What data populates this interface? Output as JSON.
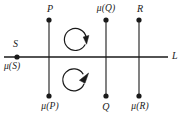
{
  "figure": {
    "type": "geometric-diagram",
    "colors": {
      "stroke": "#1a1a1a",
      "background": "#ffffff",
      "label": "#1a1a1a"
    },
    "horizontal_line": {
      "name": "L",
      "label": "L",
      "x_start": 4,
      "x_end": 168,
      "y": 57
    },
    "points": [
      {
        "id": "S",
        "label": "S",
        "label_position": "above",
        "x": 17,
        "y": 57,
        "on_line": true
      },
      {
        "id": "mu-S",
        "label": "μ(S)",
        "label_position": "below",
        "x": 17,
        "y": 57,
        "on_line": true
      },
      {
        "id": "P",
        "label": "P",
        "label_position": "above",
        "x": 49,
        "y": 20
      },
      {
        "id": "mu-P",
        "label": "μ(P)",
        "label_position": "below",
        "x": 49,
        "y": 96
      },
      {
        "id": "mu-Q",
        "label": "μ(Q)",
        "label_position": "above",
        "x": 106,
        "y": 20
      },
      {
        "id": "Q",
        "label": "Q",
        "label_position": "below",
        "x": 106,
        "y": 96
      },
      {
        "id": "R",
        "label": "R",
        "label_position": "above",
        "x": 139,
        "y": 20
      },
      {
        "id": "mu-R",
        "label": "μ(R)",
        "label_position": "below",
        "x": 139,
        "y": 96
      }
    ],
    "vertical_lines": [
      {
        "id": "line-P",
        "x": 49,
        "y_top": 20,
        "y_bottom": 96
      },
      {
        "id": "line-Q",
        "x": 106,
        "y_top": 20,
        "y_bottom": 96
      },
      {
        "id": "line-R",
        "x": 139,
        "y_top": 20,
        "y_bottom": 96
      }
    ],
    "rotation_arrows": [
      {
        "id": "arrow-upper",
        "cx": 77,
        "cy": 40,
        "r": 11,
        "direction": "clockwise",
        "region": "above-line"
      },
      {
        "id": "arrow-lower",
        "cx": 77,
        "cy": 80,
        "r": 11,
        "direction": "counterclockwise",
        "region": "below-line"
      }
    ],
    "labels": {
      "S": "S",
      "mu_S": "μ(S)",
      "P": "P",
      "mu_P": "μ(P)",
      "mu_Q": "μ(Q)",
      "Q": "Q",
      "R": "R",
      "mu_R": "μ(R)",
      "L": "L"
    }
  }
}
